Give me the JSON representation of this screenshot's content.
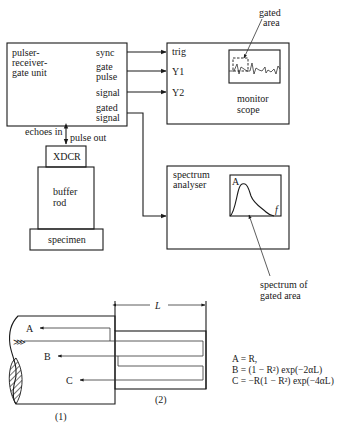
{
  "pulser_unit": {
    "title_lines": [
      "pulser-",
      "receiver-",
      "gate unit"
    ],
    "ports": {
      "sync": "sync",
      "gate_line1": "gate",
      "gate_line2": "pulse",
      "signal": "signal",
      "gated_line1": "gated",
      "gated_line2": "signal"
    },
    "echoes_in": "echoes in",
    "pulse_out": "pulse out"
  },
  "monitor_scope": {
    "inputs": {
      "trig": "trig",
      "y1": "Y1",
      "y2": "Y2"
    },
    "label_line1": "monitor",
    "label_line2": "scope",
    "annotation_line1": "gated",
    "annotation_line2": "area"
  },
  "spectrum_analyser": {
    "label_line1": "spectrum",
    "label_line2": "analyser",
    "axis_y": "A",
    "axis_x": "f",
    "annotation_line1": "spectrum of",
    "annotation_line2": "gated area"
  },
  "transducer_stack": {
    "xdcr": "XDCR",
    "buffer_line1": "buffer",
    "buffer_line2": "rod",
    "specimen": "specimen"
  },
  "reflection_diagram": {
    "dimension_label": "L",
    "region1": "(1)",
    "region2": "(2)",
    "ray_labels": {
      "a": "A",
      "b": "B",
      "c": "C"
    },
    "equations": {
      "a": "A = R,",
      "b": "B = (1 − R²) exp(−2αL)",
      "c": "C = −R(1 − R²) exp(−4αL)"
    }
  }
}
